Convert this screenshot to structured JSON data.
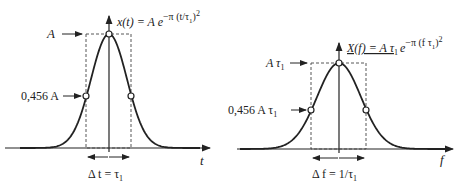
{
  "left": {
    "formula_lhs": "x(t) = A e",
    "formula_exp": "−π (t/τ",
    "formula_exp_sub": "1",
    "formula_exp_end": ")",
    "formula_sq": "2",
    "peak_label": "A",
    "half_label": "0,456 A",
    "axis_label": "t",
    "width_label": "Δ t = τ",
    "width_sub": "1"
  },
  "right": {
    "formula_lhs": "X(f) = A τ",
    "formula_lhs_sub": "1",
    "formula_e": "e",
    "formula_exp": "−π (f τ",
    "formula_exp_sub": "1",
    "formula_exp_end": ")",
    "formula_sq": "2",
    "peak_label": "A τ",
    "peak_sub": "1",
    "half_label": "0,456 A τ",
    "half_sub": "1",
    "axis_label": "f",
    "width_label": "Δ f = 1/τ",
    "width_sub": "1"
  },
  "colors": {
    "ink": "#222222",
    "background": "#ffffff"
  }
}
